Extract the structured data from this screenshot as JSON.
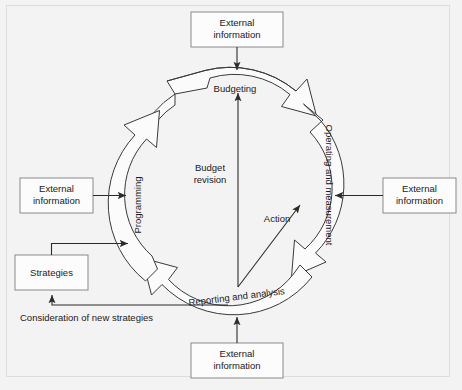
{
  "diagram": {
    "background_color": "#f3f3f3",
    "frame_color": "#dcdcdc",
    "arc_fill": "#fbfbfb",
    "arc_stroke": "#3a3a3a",
    "box_fill": "#fcfcfc",
    "box_stroke": "#8a8a8a",
    "line_color": "#2b2b2b",
    "text_color": "#1a1a1a",
    "cycle": {
      "stages": [
        {
          "id": "budgeting",
          "label": "Budgeting",
          "position": "top"
        },
        {
          "id": "operating-and-measurement",
          "label": "Operating and measurement",
          "position": "right"
        },
        {
          "id": "reporting-and-analysis",
          "label": "Reporting and analysis",
          "position": "bottom"
        },
        {
          "id": "programming",
          "label": "Programming",
          "position": "left"
        }
      ],
      "direction": "clockwise"
    },
    "inner_flows": [
      {
        "id": "budget-revision",
        "label": "Budget revision",
        "from": "reporting-and-analysis",
        "to": "budgeting"
      },
      {
        "id": "action",
        "label": "Action",
        "from": "reporting-and-analysis",
        "to": "operating-and-measurement"
      }
    ],
    "boxes": [
      {
        "id": "external-information-top",
        "label_line1": "External",
        "label_line2": "information",
        "position": "top",
        "target": "budgeting"
      },
      {
        "id": "external-information-right",
        "label_line1": "External",
        "label_line2": "information",
        "position": "right",
        "target": "operating-and-measurement"
      },
      {
        "id": "external-information-bottom",
        "label_line1": "External",
        "label_line2": "information",
        "position": "bottom",
        "target": "reporting-and-analysis"
      },
      {
        "id": "external-information-left",
        "label_line1": "External",
        "label_line2": "information",
        "position": "left",
        "target": "programming"
      },
      {
        "id": "strategies",
        "label_line1": "Strategies",
        "label_line2": "",
        "position": "bottom-left",
        "target": "programming"
      }
    ],
    "feedback": {
      "id": "consideration-of-new-strategies",
      "label": "Consideration of new strategies",
      "from": "reporting-and-analysis",
      "to": "strategies"
    }
  }
}
